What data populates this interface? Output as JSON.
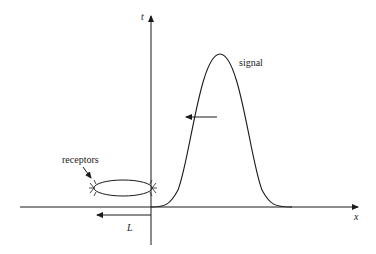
{
  "diagram": {
    "axes": {
      "vertical_label": "t",
      "horizontal_label": "x"
    },
    "labels": {
      "signal": "signal",
      "receptors": "receptors",
      "distance": "L"
    },
    "elements": {
      "signal_curve": "gaussian pulse",
      "propagation_arrow": "leftward arrow",
      "receptor_cell": "ellipse with receptors at both ends",
      "distance_marker": "double-ended arrow of length L"
    },
    "colors": {
      "stroke": "#1a1a1a",
      "background": "#ffffff"
    }
  }
}
